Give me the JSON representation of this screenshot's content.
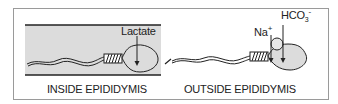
{
  "panels": [
    {
      "caption": "INSIDE EPIDIDYMIS",
      "annotation": "Lactate",
      "environment": "tube-lumen"
    },
    {
      "caption": "OUTSIDE EPIDIDYMIS",
      "annotations": {
        "sodium": "Na",
        "sodium_sup": "+",
        "bicarbonate": "HCO",
        "bicarbonate_sub": "3",
        "bicarbonate_sup": "-"
      }
    }
  ],
  "colors": {
    "frame_border": "#9a9a9a",
    "lumen_fill": "#dcdcdc",
    "line": "#222222",
    "head_fill_outside": "#dcdcdc"
  }
}
